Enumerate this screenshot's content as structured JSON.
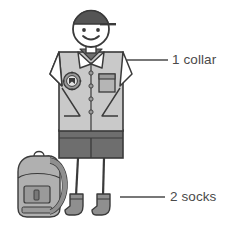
{
  "illustration": {
    "title": "School uniform parts diagram",
    "subject": "stick figure child wearing school uniform with backpack",
    "background_color": "#ffffff"
  },
  "annotations": [
    {
      "id": "collar",
      "count": "1",
      "text": "1 collar",
      "part": "collar",
      "leader_line": {
        "x1": 127,
        "y1": 60,
        "x2": 168,
        "y2": 60
      },
      "label_position": {
        "x": 172,
        "y": 53
      }
    },
    {
      "id": "socks",
      "count": "2",
      "text": "2 socks",
      "part": "socks",
      "leader_line": {
        "x1": 120,
        "y1": 197,
        "x2": 165,
        "y2": 197
      },
      "label_position": {
        "x": 170,
        "y": 190
      }
    }
  ],
  "figure_parts": [
    {
      "name": "cap",
      "color": "#555555"
    },
    {
      "name": "head",
      "color": "#ffffff"
    },
    {
      "name": "smiley-face",
      "color": "#3a3a3a"
    },
    {
      "name": "shirt",
      "color": "#c9c9c9"
    },
    {
      "name": "collar",
      "color": "#ffffff"
    },
    {
      "name": "crest-badge",
      "color": "#8f8f8f"
    },
    {
      "name": "shirt-pocket",
      "color": "#b5b5b5"
    },
    {
      "name": "buttons",
      "color": "#8a8a8a"
    },
    {
      "name": "shorts",
      "color": "#6e6e6e"
    },
    {
      "name": "legs",
      "color": "#3a3a3a"
    },
    {
      "name": "socks",
      "color": "#8a8a8a"
    },
    {
      "name": "backpack",
      "color": "#a8a8a8"
    }
  ],
  "colors": {
    "outline": "#3a3a3a",
    "text": "#4a4a4a",
    "leader_line": "#4a4a4a",
    "shirt_light": "#c9c9c9",
    "shirt_mid": "#bdbdbd",
    "shorts_dark": "#6e6e6e",
    "cap_dark": "#555555",
    "backpack_body": "#a8a8a8",
    "backpack_strap": "#8f8f8f"
  }
}
